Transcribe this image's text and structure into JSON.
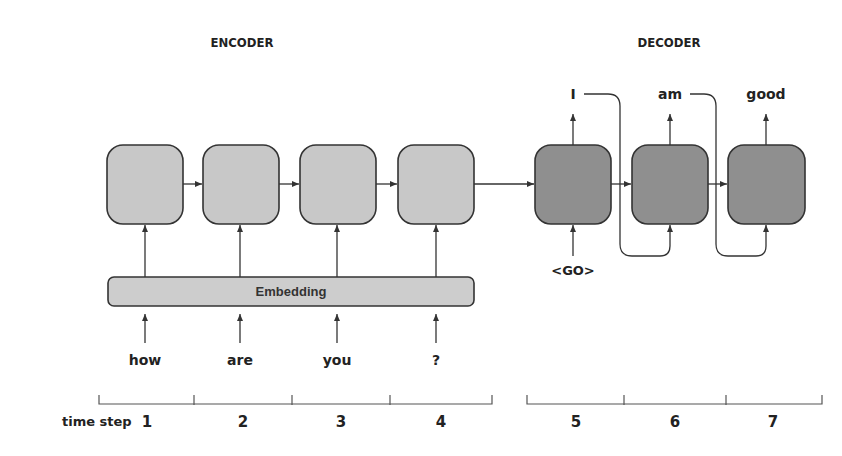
{
  "titles": {
    "encoder": "ENCODER",
    "decoder": "DECODER"
  },
  "embedding_label": "Embedding",
  "inputs": [
    "how",
    "are",
    "you",
    "?"
  ],
  "decoder_input": "<GO>",
  "outputs": [
    "I",
    "am",
    "good"
  ],
  "time_step_label": "time step",
  "time_steps": [
    "1",
    "2",
    "3",
    "4",
    "5",
    "6",
    "7"
  ],
  "colors": {
    "encoder_cell": "#c8c8c8",
    "decoder_cell": "#8f8f8f",
    "embedding": "#cdcdcd",
    "stroke": "#333333"
  }
}
